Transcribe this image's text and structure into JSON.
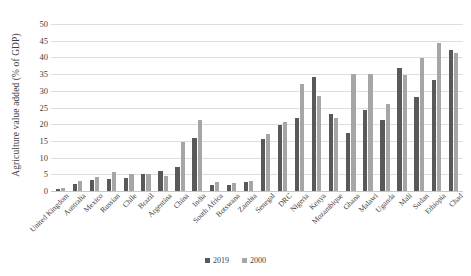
{
  "chart_data": {
    "type": "bar",
    "title": "",
    "xlabel": "",
    "ylabel": "Agriculture value added (% of GDP)",
    "ylim": [
      0,
      50
    ],
    "ytick_step": 5,
    "yticks": [
      "50",
      "45",
      "40",
      "35",
      "30",
      "25",
      "20",
      "15",
      "10",
      "5",
      "0"
    ],
    "grid": true,
    "legend_position": "bottom",
    "categories": [
      "United Kingdom",
      "Australia",
      "Mexico",
      "Russian",
      "Chile",
      "Brazil",
      "Argentina",
      "China",
      "India",
      "South Africa",
      "Botswana",
      "Zambia",
      "Senegal",
      "DRC",
      "Nigeria",
      "Kenya",
      "Mozambique",
      "Ghana",
      "Malawi",
      "Uganda",
      "Mali",
      "Sudan",
      "Ethiopia",
      "Chad"
    ],
    "series": [
      {
        "name": "2019",
        "color": "#595959",
        "values": [
          0.6,
          2.0,
          3.4,
          3.6,
          3.8,
          5.2,
          6.1,
          7.1,
          16.0,
          1.9,
          1.8,
          2.7,
          15.5,
          19.7,
          21.9,
          34.2,
          23.0,
          17.4,
          24.4,
          21.4,
          36.7,
          28.0,
          33.3,
          42.3
        ]
      },
      {
        "name": "2000",
        "color": "#a6a6a6",
        "values": [
          0.8,
          3.0,
          4.1,
          5.6,
          5.2,
          5.0,
          4.5,
          14.7,
          21.3,
          2.8,
          2.4,
          3.0,
          17.1,
          20.7,
          31.9,
          28.4,
          22.0,
          35.1,
          35.0,
          26.2,
          34.8,
          39.8,
          44.3,
          41.2
        ]
      }
    ]
  },
  "legend": {
    "items": [
      {
        "label": "2019",
        "color": "#595959"
      },
      {
        "label": "2000",
        "color": "#a6a6a6"
      }
    ]
  }
}
